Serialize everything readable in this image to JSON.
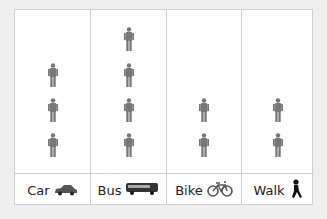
{
  "chart_data": {
    "type": "pictogram",
    "title": "",
    "categories": [
      "Car",
      "Bus",
      "Bike",
      "Walk"
    ],
    "values": [
      3,
      4,
      2,
      2
    ],
    "unit_icon": "person-icon",
    "category_icons": [
      "car-icon",
      "bus-icon",
      "bike-icon",
      "walk-icon"
    ],
    "colors": {
      "figure": "#777777",
      "grid": "#cfcfcf",
      "background": "#ffffff"
    }
  },
  "columns": [
    {
      "label": "Car",
      "count": 3
    },
    {
      "label": "Bus",
      "count": 4
    },
    {
      "label": "Bike",
      "count": 2
    },
    {
      "label": "Walk",
      "count": 2
    }
  ]
}
